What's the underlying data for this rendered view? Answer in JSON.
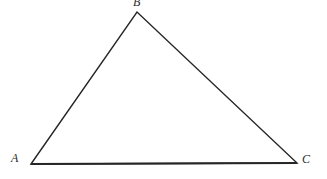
{
  "figure": {
    "background_color": "#ffffff",
    "stroke_color": "#262626",
    "label_color": "#2b2b2b",
    "canvas": {
      "width": 327,
      "height": 179
    },
    "vertices": [
      {
        "name": "A",
        "label": "A",
        "x": 31,
        "y": 164,
        "label_x": 11,
        "label_y": 152
      },
      {
        "name": "B",
        "label": "B",
        "x": 137,
        "y": 12,
        "label_x": 133,
        "label_y": -4
      },
      {
        "name": "C",
        "label": "C",
        "x": 297,
        "y": 163,
        "label_x": 302,
        "label_y": 153
      }
    ],
    "edges": [
      {
        "name": "AB",
        "from": "A",
        "to": "B",
        "stroke_width": 1.4
      },
      {
        "name": "BC",
        "from": "B",
        "to": "C",
        "stroke_width": 1.4
      },
      {
        "name": "AC",
        "from": "A",
        "to": "C",
        "stroke_width": 2.2
      }
    ],
    "path_points": "31,164 137,12 297,163"
  }
}
